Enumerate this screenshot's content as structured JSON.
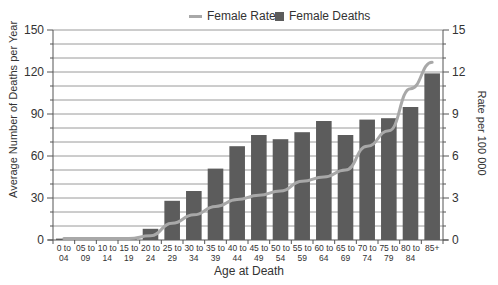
{
  "chart_data": {
    "type": "bar",
    "title": "",
    "legend": [
      {
        "name": "Female Rates",
        "kind": "line",
        "color": "#a8a8a8"
      },
      {
        "name": "Female Deaths",
        "kind": "bar",
        "color": "#5c5c5c"
      }
    ],
    "legend_position": "top",
    "xlabel": "Age at Death",
    "ylabel": "Average Number of Deaths per Year",
    "y2label": "Rate per 100 000",
    "ylim": [
      0,
      150
    ],
    "y2lim": [
      0,
      15
    ],
    "yticks": [
      0,
      30,
      60,
      90,
      120,
      150
    ],
    "y2ticks": [
      0,
      3,
      6,
      9,
      12,
      15
    ],
    "grid": true,
    "categories": [
      [
        "0 to",
        "04"
      ],
      [
        "05 to",
        "09"
      ],
      [
        "10 to",
        "14"
      ],
      [
        "15 to",
        "19"
      ],
      [
        "20 to",
        "24"
      ],
      [
        "25 to",
        "29"
      ],
      [
        "30 to",
        "34"
      ],
      [
        "35 to",
        "39"
      ],
      [
        "40 to",
        "44"
      ],
      [
        "45 to",
        "49"
      ],
      [
        "50 to",
        "54"
      ],
      [
        "55 to",
        "59"
      ],
      [
        "60 to",
        "64"
      ],
      [
        "65 to",
        "69"
      ],
      [
        "70 to",
        "74"
      ],
      [
        "75 to",
        "79"
      ],
      [
        "80 to",
        "84"
      ],
      [
        "85+",
        ""
      ]
    ],
    "series": [
      {
        "name": "Female Deaths",
        "type": "bar",
        "axis": "left",
        "values": [
          1,
          1,
          1,
          1,
          8,
          28,
          35,
          51,
          67,
          75,
          72,
          77,
          85,
          75,
          86,
          87,
          95,
          119
        ]
      },
      {
        "name": "Female Rates",
        "type": "line",
        "axis": "right",
        "values": [
          0.1,
          0.1,
          0.1,
          0.1,
          0.3,
          1.2,
          1.8,
          2.4,
          2.9,
          3.2,
          3.5,
          4.2,
          4.5,
          5.0,
          6.7,
          7.8,
          10.8,
          12.7
        ]
      }
    ]
  },
  "labels": {
    "legend_rates": "Female Rates",
    "legend_deaths": "Female Deaths",
    "ylabel_left": "Average Number of Deaths per Year",
    "ylabel_right": "Rate per 100 000",
    "xlabel": "Age at Death"
  },
  "colors": {
    "bar": "#5c5c5c",
    "line": "#a8a8a8",
    "grid": "#9a9a9a",
    "axis": "#555555",
    "text": "#333333"
  }
}
